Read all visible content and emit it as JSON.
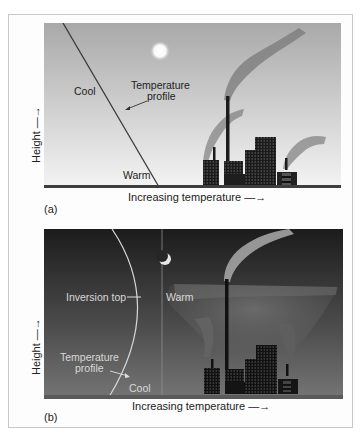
{
  "figure": {
    "panels": [
      {
        "tag": "(a)",
        "condition": "daytime",
        "y_axis_label": "Height",
        "x_axis_label": "Increasing temperature",
        "labels": {
          "cool": "Cool",
          "warm": "Warm",
          "profile_line1": "Temperature",
          "profile_line2": "profile"
        },
        "colors": {
          "sky_top": "#a8a8a8",
          "sky_bottom": "#f2f2f2",
          "profile_line": "#333333"
        }
      },
      {
        "tag": "(b)",
        "condition": "night inversion",
        "y_axis_label": "Height",
        "x_axis_label": "Increasing temperature",
        "labels": {
          "warm": "Warm",
          "cool": "Cool",
          "inversion_top": "Inversion top",
          "profile_line1": "Temperature",
          "profile_line2": "profile"
        },
        "colors": {
          "sky_top": "#1e1e1e",
          "sky_bottom": "#6e6e6e",
          "profile_line": "#d8d8d8"
        }
      }
    ]
  }
}
